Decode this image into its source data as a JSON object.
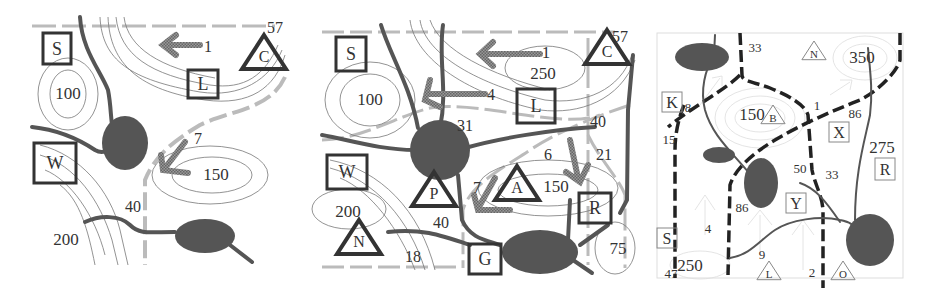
{
  "colors": {
    "lake": "#555555",
    "river": "#555555",
    "contour": "#777777",
    "gray_dash": "#bbbbbb",
    "black_dash": "#222222",
    "arrow": "#888888",
    "faint": "#cccccc",
    "symbol_stroke": "#333333"
  },
  "panels": [
    {
      "id": "panel-1",
      "squares": [
        {
          "label": "S",
          "x": 43,
          "y": 33,
          "w": 28,
          "h": 31
        },
        {
          "label": "L",
          "x": 188,
          "y": 70,
          "w": 30,
          "h": 28
        },
        {
          "label": "W",
          "x": 34,
          "y": 143,
          "w": 42,
          "h": 40
        }
      ],
      "triangles": [
        {
          "label": "C",
          "cx": 264,
          "cy": 55
        }
      ],
      "ellipse_labels": [
        {
          "text": "100",
          "x": 68,
          "y": 99
        },
        {
          "text": "150",
          "x": 216,
          "y": 180
        },
        {
          "text": "200",
          "x": 66,
          "y": 245
        }
      ],
      "numbers": [
        {
          "text": "57",
          "x": 275,
          "y": 33
        },
        {
          "text": "1",
          "x": 208,
          "y": 52
        },
        {
          "text": "7",
          "x": 198,
          "y": 144
        },
        {
          "text": "40",
          "x": 133,
          "y": 212
        }
      ]
    },
    {
      "id": "panel-2",
      "squares": [
        {
          "label": "S",
          "x": 336,
          "y": 37,
          "w": 30,
          "h": 34
        },
        {
          "label": "L",
          "x": 517,
          "y": 89,
          "w": 38,
          "h": 34
        },
        {
          "label": "W",
          "x": 327,
          "y": 155,
          "w": 40,
          "h": 34
        },
        {
          "label": "R",
          "x": 579,
          "y": 193,
          "w": 32,
          "h": 30
        },
        {
          "label": "G",
          "x": 469,
          "y": 244,
          "w": 32,
          "h": 30
        }
      ],
      "triangles": [
        {
          "label": "C",
          "cx": 607,
          "cy": 50
        },
        {
          "label": "A",
          "cx": 517,
          "cy": 186
        },
        {
          "label": "P",
          "cx": 434,
          "cy": 192
        },
        {
          "label": "N",
          "cx": 359,
          "cy": 240
        }
      ],
      "ellipse_labels": [
        {
          "text": "1",
          "x": 546,
          "y": 58
        },
        {
          "text": "250",
          "x": 543,
          "y": 79
        },
        {
          "text": "100",
          "x": 370,
          "y": 105
        },
        {
          "text": "150",
          "x": 556,
          "y": 192
        },
        {
          "text": "200",
          "x": 348,
          "y": 217
        },
        {
          "text": "75",
          "x": 618,
          "y": 254
        }
      ],
      "numbers": [
        {
          "text": "57",
          "x": 620,
          "y": 42
        },
        {
          "text": "4",
          "x": 491,
          "y": 100
        },
        {
          "text": "31",
          "x": 465,
          "y": 131
        },
        {
          "text": "40",
          "x": 598,
          "y": 127
        },
        {
          "text": "6",
          "x": 548,
          "y": 160
        },
        {
          "text": "21",
          "x": 604,
          "y": 160
        },
        {
          "text": "7",
          "x": 477,
          "y": 193
        },
        {
          "text": "40",
          "x": 441,
          "y": 228
        },
        {
          "text": "18",
          "x": 413,
          "y": 262
        }
      ]
    },
    {
      "id": "panel-3",
      "squares": [
        {
          "label": "K",
          "x": 662,
          "y": 92,
          "w": 20,
          "h": 20
        },
        {
          "label": "X",
          "x": 829,
          "y": 122,
          "w": 20,
          "h": 20
        },
        {
          "label": "R",
          "x": 875,
          "y": 158,
          "w": 20,
          "h": 22
        },
        {
          "label": "Y",
          "x": 786,
          "y": 193,
          "w": 20,
          "h": 20
        },
        {
          "label": "S",
          "x": 657,
          "y": 228,
          "w": 20,
          "h": 20
        }
      ],
      "triangles": [
        {
          "label": "N",
          "cx": 814,
          "cy": 52
        },
        {
          "label": "B",
          "cx": 773,
          "cy": 116
        },
        {
          "label": "L",
          "cx": 769,
          "cy": 272
        },
        {
          "label": "O",
          "cx": 843,
          "cy": 272
        }
      ],
      "ellipse_labels": [
        {
          "text": "350",
          "x": 862,
          "y": 63
        },
        {
          "text": "150",
          "x": 752,
          "y": 120
        },
        {
          "text": "275",
          "x": 882,
          "y": 153
        },
        {
          "text": "250",
          "x": 690,
          "y": 271
        }
      ],
      "numbers": [
        {
          "text": "33",
          "x": 755,
          "y": 52
        },
        {
          "text": "8",
          "x": 688,
          "y": 112
        },
        {
          "text": "1",
          "x": 817,
          "y": 110
        },
        {
          "text": "86",
          "x": 855,
          "y": 118
        },
        {
          "text": "15",
          "x": 669,
          "y": 144
        },
        {
          "text": "50",
          "x": 800,
          "y": 173
        },
        {
          "text": "33",
          "x": 832,
          "y": 179
        },
        {
          "text": "86",
          "x": 742,
          "y": 212
        },
        {
          "text": "4",
          "x": 708,
          "y": 233
        },
        {
          "text": "9",
          "x": 762,
          "y": 259
        },
        {
          "text": "47",
          "x": 671,
          "y": 278
        },
        {
          "text": "2",
          "x": 812,
          "y": 277
        }
      ]
    }
  ]
}
